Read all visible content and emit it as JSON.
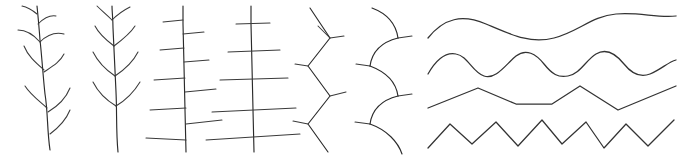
{
  "canvas": {
    "width": 689,
    "height": 158,
    "background_color": "#ffffff",
    "stroke_color": "#2b2b2b",
    "style": "hand-drawn thin black line figures, no text labels"
  },
  "figures": [
    {
      "id": "fig-1",
      "name": "alternate-curved-branch-stem",
      "description": "vertical slightly wavy stem with alternating curved branches arcing upward",
      "branch_arrangement": "alternate",
      "branch_shape": "curved",
      "branch_count": 8
    },
    {
      "id": "fig-2",
      "name": "opposite-curved-branch-stem",
      "description": "vertical stem with opposite paired curved branches arcing upward",
      "branch_arrangement": "opposite",
      "branch_shape": "curved",
      "branch_count": 10
    },
    {
      "id": "fig-3",
      "name": "alternate-straight-branch-stem",
      "description": "vertical stem with alternating straight horizontal branches increasing in length downward",
      "branch_arrangement": "alternate",
      "branch_shape": "straight",
      "branch_count": 9
    },
    {
      "id": "fig-4",
      "name": "opposite-straight-branch-stem",
      "description": "vertical stem with opposite straight horizontal branches increasing in length downward",
      "branch_arrangement": "opposite",
      "branch_shape": "straight",
      "branch_count": 6
    },
    {
      "id": "fig-5",
      "name": "zigzag-stem-with-ticks",
      "description": "zigzag vertical stem with short straight branch at each vertex",
      "branch_arrangement": "alternate",
      "branch_shape": "straight",
      "branch_count": 5
    },
    {
      "id": "fig-6",
      "name": "arc-chain-with-ticks",
      "description": "chain of downward scalloped arcs with small tick branches at each joint",
      "branch_arrangement": "alternate",
      "branch_shape": "curved",
      "branch_count": 5
    },
    {
      "id": "fig-7",
      "name": "sine-wave-low-frequency",
      "description": "smooth horizontal sine wave, long wavelength",
      "wave_type": "sine",
      "cycles": 2.5,
      "amplitude_px": 17
    },
    {
      "id": "fig-8",
      "name": "sine-wave-high-frequency",
      "description": "smooth horizontal sine wave, short wavelength",
      "wave_type": "sine",
      "cycles": 4.5,
      "amplitude_px": 13
    },
    {
      "id": "fig-9",
      "name": "triangle-wave-low-frequency",
      "description": "angular zigzag horizontal wave, long wavelength",
      "wave_type": "triangle",
      "cycles": 2.5,
      "amplitude_px": 16
    },
    {
      "id": "fig-10",
      "name": "triangle-wave-high-frequency",
      "description": "angular zigzag horizontal wave, short wavelength",
      "wave_type": "triangle",
      "cycles": 5,
      "amplitude_px": 15
    }
  ]
}
